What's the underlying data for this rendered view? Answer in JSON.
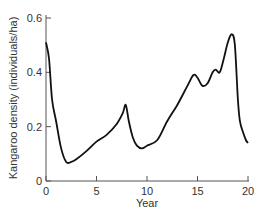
{
  "chart_data": {
    "type": "line",
    "title": "",
    "xlabel": "Year",
    "ylabel": "Kangaroo density (individuals/ha)",
    "xlim": [
      0,
      20
    ],
    "ylim": [
      0,
      0.6
    ],
    "xticks": [
      "0",
      "5",
      "10",
      "15",
      "20"
    ],
    "yticks": [
      "0",
      "0.2",
      "0.4",
      "0.6"
    ],
    "grid": false,
    "legend": null,
    "series": [
      {
        "name": "Kangaroo density",
        "x": [
          0,
          0.3,
          0.6,
          1.0,
          1.5,
          2.0,
          2.5,
          3.0,
          4.0,
          5.0,
          6.0,
          7.0,
          7.6,
          7.9,
          8.2,
          8.6,
          9.0,
          9.5,
          10.0,
          11.0,
          12.0,
          13.0,
          14.0,
          14.6,
          15.0,
          15.5,
          16.0,
          16.5,
          16.8,
          17.2,
          17.6,
          18.0,
          18.4,
          18.7,
          19.0,
          19.2,
          19.5,
          19.8,
          20.0
        ],
        "y": [
          0.51,
          0.45,
          0.3,
          0.22,
          0.12,
          0.07,
          0.07,
          0.08,
          0.11,
          0.145,
          0.17,
          0.21,
          0.25,
          0.28,
          0.22,
          0.16,
          0.13,
          0.12,
          0.13,
          0.15,
          0.22,
          0.28,
          0.35,
          0.39,
          0.38,
          0.35,
          0.36,
          0.4,
          0.41,
          0.4,
          0.45,
          0.51,
          0.54,
          0.5,
          0.3,
          0.22,
          0.18,
          0.15,
          0.14
        ]
      }
    ]
  }
}
